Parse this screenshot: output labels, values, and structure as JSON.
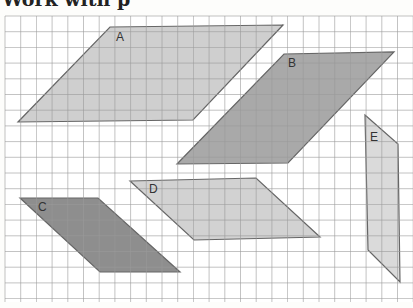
{
  "heading": {
    "text": "Work with p"
  },
  "grid": {
    "x0": 5,
    "y0": 16,
    "x1": 413,
    "y1": 302,
    "step": 15.7,
    "line_color": "#9a9a9a",
    "background": "#ffffff"
  },
  "shapes": [
    {
      "label": "A",
      "fill": "#cfcfcf",
      "points": "110,27 283,25 193,120 18,122",
      "label_pos": [
        116,
        41
      ]
    },
    {
      "label": "B",
      "fill": "#a9a9a9",
      "points": "284,54 394,52 288,163 177,164",
      "label_pos": [
        288,
        67
      ]
    },
    {
      "label": "C",
      "fill": "#8e8e8e",
      "points": "20,198 98,198 180,272 100,272",
      "label_pos": [
        38,
        211
      ]
    },
    {
      "label": "D",
      "fill": "#d2d2d2",
      "points": "130,181 256,178 320,237 194,240",
      "label_pos": [
        149,
        193
      ]
    },
    {
      "label": "E",
      "fill": "#dadada",
      "points": "365,115 398,144 400,282 368,250",
      "label_pos": [
        370,
        141
      ]
    }
  ]
}
